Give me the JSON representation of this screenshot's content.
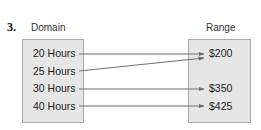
{
  "problem_number": "3.",
  "domain": {
    "label": "Domain",
    "items": [
      "20 Hours",
      "25 Hours",
      "30 Hours",
      "40 Hours"
    ]
  },
  "range": {
    "label": "Range",
    "items": [
      "$200",
      "$350",
      "$425"
    ]
  },
  "mapping": [
    {
      "from": "20 Hours",
      "to": "$200"
    },
    {
      "from": "25 Hours",
      "to": "$200"
    },
    {
      "from": "30 Hours",
      "to": "$350"
    },
    {
      "from": "40 Hours",
      "to": "$425"
    }
  ],
  "colors": {
    "box_fill": "#e6e6e6",
    "box_border": "#a9a9a9",
    "arrow": "#6e6e6e"
  }
}
